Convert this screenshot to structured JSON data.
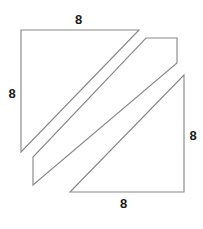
{
  "figure": {
    "canvas": {
      "width": 203,
      "height": 229
    },
    "stroke_color": "#8a8a8a",
    "fill_color": "#ffffff",
    "label_color": "#1a1a1a",
    "labels": {
      "top": "8",
      "left": "8",
      "right": "8",
      "bottom": "8"
    },
    "pieces": [
      {
        "name": "upper-left-triangle",
        "points": "21,30 139,30 21,152"
      },
      {
        "name": "middle-parallelogram-piece",
        "points": "146,38 177,38 177,63 33,185 33,157"
      },
      {
        "name": "lower-right-triangle",
        "points": "184,75 184,192 70,192"
      }
    ]
  },
  "chart_data": {
    "type": "diagram",
    "shape": "square",
    "side_length": 8,
    "side_labels": [
      "8",
      "8",
      "8",
      "8"
    ],
    "pieces": 3,
    "piece_names": [
      "upper-left-triangle",
      "middle-parallelogram-piece",
      "lower-right-triangle"
    ],
    "xlabel": "",
    "ylabel": "",
    "grid": false,
    "legend": false
  }
}
